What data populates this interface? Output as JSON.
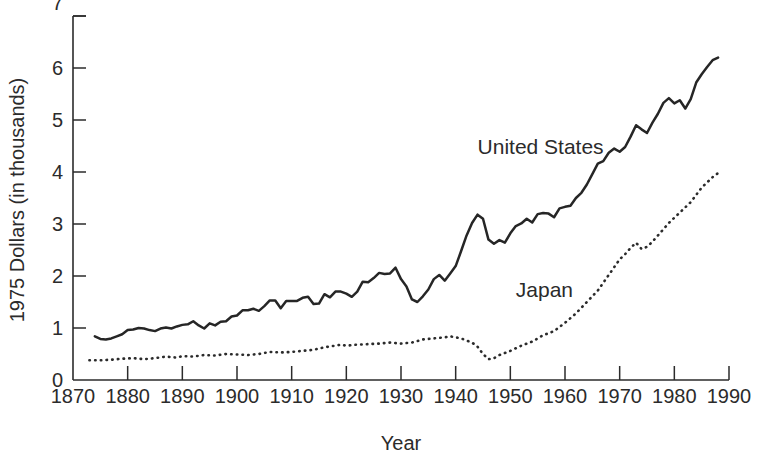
{
  "chart_data": {
    "type": "line",
    "title": "",
    "xlabel": "Year",
    "ylabel": "1975 Dollars (in thousands)",
    "xlim": [
      1870,
      1990
    ],
    "ylim": [
      0,
      7
    ],
    "grid": false,
    "legend_position": "inline-annotations",
    "xticks": [
      "1870",
      "1880",
      "1890",
      "1900",
      "1910",
      "1920",
      "1930",
      "1940",
      "1950",
      "1960",
      "1970",
      "1980",
      "1990"
    ],
    "yticks": [
      "0",
      "1",
      "2",
      "3",
      "4",
      "5",
      "6",
      "7"
    ],
    "ytick_top_clipped": true,
    "annotations": [
      {
        "text": "United States",
        "x": 1944,
        "y": 4.35
      },
      {
        "text": "Japan",
        "x": 1951,
        "y": 1.6
      }
    ],
    "series": [
      {
        "name": "United States",
        "style": "solid",
        "color": "#262626",
        "points": [
          [
            1874,
            0.84
          ],
          [
            1875,
            0.79
          ],
          [
            1876,
            0.78
          ],
          [
            1877,
            0.8
          ],
          [
            1878,
            0.84
          ],
          [
            1879,
            0.88
          ],
          [
            1880,
            0.96
          ],
          [
            1881,
            0.97
          ],
          [
            1882,
            1.0
          ],
          [
            1883,
            0.99
          ],
          [
            1884,
            0.96
          ],
          [
            1885,
            0.94
          ],
          [
            1886,
            0.99
          ],
          [
            1887,
            1.01
          ],
          [
            1888,
            0.99
          ],
          [
            1889,
            1.03
          ],
          [
            1890,
            1.06
          ],
          [
            1891,
            1.07
          ],
          [
            1892,
            1.13
          ],
          [
            1893,
            1.05
          ],
          [
            1894,
            0.99
          ],
          [
            1895,
            1.09
          ],
          [
            1896,
            1.05
          ],
          [
            1897,
            1.12
          ],
          [
            1898,
            1.13
          ],
          [
            1899,
            1.22
          ],
          [
            1900,
            1.24
          ],
          [
            1901,
            1.34
          ],
          [
            1902,
            1.34
          ],
          [
            1903,
            1.37
          ],
          [
            1904,
            1.33
          ],
          [
            1905,
            1.42
          ],
          [
            1906,
            1.53
          ],
          [
            1907,
            1.53
          ],
          [
            1908,
            1.38
          ],
          [
            1909,
            1.52
          ],
          [
            1910,
            1.52
          ],
          [
            1911,
            1.52
          ],
          [
            1912,
            1.58
          ],
          [
            1913,
            1.6
          ],
          [
            1914,
            1.46
          ],
          [
            1915,
            1.47
          ],
          [
            1916,
            1.65
          ],
          [
            1917,
            1.59
          ],
          [
            1918,
            1.7
          ],
          [
            1919,
            1.7
          ],
          [
            1920,
            1.66
          ],
          [
            1921,
            1.6
          ],
          [
            1922,
            1.7
          ],
          [
            1923,
            1.89
          ],
          [
            1924,
            1.88
          ],
          [
            1925,
            1.96
          ],
          [
            1926,
            2.06
          ],
          [
            1927,
            2.04
          ],
          [
            1928,
            2.05
          ],
          [
            1929,
            2.16
          ],
          [
            1930,
            1.94
          ],
          [
            1931,
            1.8
          ],
          [
            1932,
            1.55
          ],
          [
            1933,
            1.5
          ],
          [
            1934,
            1.61
          ],
          [
            1935,
            1.74
          ],
          [
            1936,
            1.94
          ],
          [
            1937,
            2.02
          ],
          [
            1938,
            1.91
          ],
          [
            1939,
            2.05
          ],
          [
            1940,
            2.19
          ],
          [
            1941,
            2.48
          ],
          [
            1942,
            2.78
          ],
          [
            1943,
            3.02
          ],
          [
            1944,
            3.18
          ],
          [
            1945,
            3.1
          ],
          [
            1946,
            2.7
          ],
          [
            1947,
            2.62
          ],
          [
            1948,
            2.69
          ],
          [
            1949,
            2.64
          ],
          [
            1950,
            2.82
          ],
          [
            1951,
            2.96
          ],
          [
            1952,
            3.01
          ],
          [
            1953,
            3.1
          ],
          [
            1954,
            3.03
          ],
          [
            1955,
            3.19
          ],
          [
            1956,
            3.21
          ],
          [
            1957,
            3.2
          ],
          [
            1958,
            3.13
          ],
          [
            1959,
            3.3
          ],
          [
            1960,
            3.33
          ],
          [
            1961,
            3.35
          ],
          [
            1962,
            3.5
          ],
          [
            1963,
            3.6
          ],
          [
            1964,
            3.76
          ],
          [
            1965,
            3.96
          ],
          [
            1966,
            4.16
          ],
          [
            1967,
            4.21
          ],
          [
            1968,
            4.37
          ],
          [
            1969,
            4.45
          ],
          [
            1970,
            4.39
          ],
          [
            1971,
            4.48
          ],
          [
            1972,
            4.68
          ],
          [
            1973,
            4.9
          ],
          [
            1974,
            4.82
          ],
          [
            1975,
            4.75
          ],
          [
            1976,
            4.95
          ],
          [
            1977,
            5.12
          ],
          [
            1978,
            5.33
          ],
          [
            1979,
            5.42
          ],
          [
            1980,
            5.32
          ],
          [
            1981,
            5.38
          ],
          [
            1982,
            5.22
          ],
          [
            1983,
            5.4
          ],
          [
            1984,
            5.72
          ],
          [
            1985,
            5.88
          ],
          [
            1986,
            6.02
          ],
          [
            1987,
            6.15
          ],
          [
            1988,
            6.2
          ]
        ]
      },
      {
        "name": "Japan",
        "style": "dotted",
        "color": "#2b2b2b",
        "points": [
          [
            1873,
            0.38
          ],
          [
            1875,
            0.38
          ],
          [
            1877,
            0.39
          ],
          [
            1879,
            0.41
          ],
          [
            1881,
            0.42
          ],
          [
            1883,
            0.4
          ],
          [
            1885,
            0.42
          ],
          [
            1887,
            0.45
          ],
          [
            1889,
            0.43
          ],
          [
            1890,
            0.46
          ],
          [
            1892,
            0.45
          ],
          [
            1894,
            0.48
          ],
          [
            1896,
            0.47
          ],
          [
            1898,
            0.5
          ],
          [
            1900,
            0.49
          ],
          [
            1902,
            0.48
          ],
          [
            1904,
            0.5
          ],
          [
            1906,
            0.54
          ],
          [
            1908,
            0.53
          ],
          [
            1910,
            0.54
          ],
          [
            1912,
            0.56
          ],
          [
            1914,
            0.58
          ],
          [
            1916,
            0.63
          ],
          [
            1918,
            0.66
          ],
          [
            1919,
            0.68
          ],
          [
            1920,
            0.66
          ],
          [
            1922,
            0.68
          ],
          [
            1924,
            0.69
          ],
          [
            1926,
            0.7
          ],
          [
            1928,
            0.72
          ],
          [
            1930,
            0.7
          ],
          [
            1932,
            0.72
          ],
          [
            1934,
            0.78
          ],
          [
            1936,
            0.8
          ],
          [
            1938,
            0.82
          ],
          [
            1939,
            0.84
          ],
          [
            1940,
            0.82
          ],
          [
            1941,
            0.8
          ],
          [
            1942,
            0.76
          ],
          [
            1943,
            0.72
          ],
          [
            1944,
            0.64
          ],
          [
            1945,
            0.5
          ],
          [
            1946,
            0.4
          ],
          [
            1947,
            0.42
          ],
          [
            1948,
            0.48
          ],
          [
            1950,
            0.56
          ],
          [
            1952,
            0.66
          ],
          [
            1954,
            0.74
          ],
          [
            1956,
            0.86
          ],
          [
            1958,
            0.94
          ],
          [
            1960,
            1.1
          ],
          [
            1962,
            1.28
          ],
          [
            1964,
            1.5
          ],
          [
            1966,
            1.72
          ],
          [
            1968,
            2.02
          ],
          [
            1970,
            2.32
          ],
          [
            1971,
            2.42
          ],
          [
            1972,
            2.54
          ],
          [
            1973,
            2.64
          ],
          [
            1974,
            2.52
          ],
          [
            1975,
            2.56
          ],
          [
            1976,
            2.66
          ],
          [
            1977,
            2.78
          ],
          [
            1978,
            2.9
          ],
          [
            1979,
            3.02
          ],
          [
            1980,
            3.12
          ],
          [
            1981,
            3.22
          ],
          [
            1982,
            3.32
          ],
          [
            1983,
            3.42
          ],
          [
            1984,
            3.56
          ],
          [
            1985,
            3.7
          ],
          [
            1986,
            3.8
          ],
          [
            1987,
            3.9
          ],
          [
            1988,
            3.98
          ]
        ]
      }
    ]
  },
  "axis": {
    "x_title": "Year",
    "y_title": "1975 Dollars (in thousands)"
  }
}
